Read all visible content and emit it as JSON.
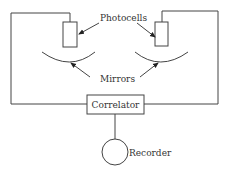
{
  "diagram": {
    "labels": {
      "photocells": "Photocells",
      "mirrors": "Mirrors",
      "correlator": "Correlator",
      "recorder": "Recorder"
    },
    "colors": {
      "line": "#444444",
      "text": "#333333",
      "background": "#ffffff"
    }
  }
}
